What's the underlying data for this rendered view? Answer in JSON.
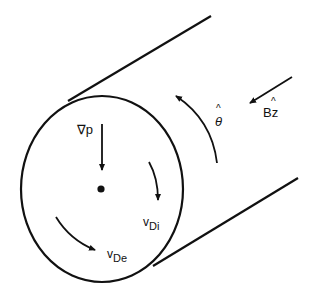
{
  "diagram": {
    "labels": {
      "grad_p": "∇p",
      "theta_hat": "θ",
      "hat": "^",
      "b_field": "Bz",
      "v_di_main": "v",
      "v_di_sub": "Di",
      "v_de_main": "v",
      "v_de_sub": "De"
    },
    "colors": {
      "ink": "#111111",
      "background": "#ffffff"
    }
  }
}
